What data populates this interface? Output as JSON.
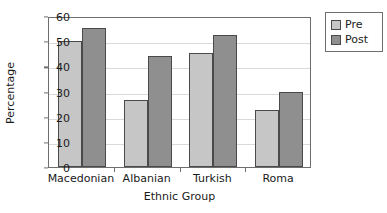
{
  "chart_data": {
    "type": "bar",
    "title": "",
    "subtitle": "",
    "xlabel": "Ethnic Group",
    "ylabel": "Percentage",
    "categories": [
      "Macedonian",
      "Albanian",
      "Turkish",
      "Roma"
    ],
    "series": [
      {
        "name": "Pre",
        "values": [
          50.0,
          26.7,
          45.3,
          22.7
        ],
        "color": "#c6c6c6"
      },
      {
        "name": "Post",
        "values": [
          55.4,
          44.2,
          52.5,
          30.0
        ],
        "color": "#8f8f8f"
      }
    ],
    "ylim": [
      0,
      60
    ],
    "yticks": [
      0,
      10,
      20,
      30,
      40,
      50,
      60
    ],
    "ytick_labels": [
      "0",
      "10",
      "20",
      "30",
      "40",
      "50",
      "60"
    ],
    "grid": true,
    "grid_axis": "y",
    "legend": {
      "position": "top-right",
      "entries": [
        "Pre",
        "Post"
      ]
    },
    "annotations": []
  },
  "legend": {
    "entries": [
      {
        "label": "Pre",
        "color": "#c6c6c6"
      },
      {
        "label": "Post",
        "color": "#8f8f8f"
      }
    ]
  },
  "axes": {
    "y_title": "Percentage",
    "x_title": "Ethnic Group"
  },
  "colors": {
    "pre": "#c6c6c6",
    "post": "#8f8f8f",
    "bar_edge": "#4a4a4a",
    "frame": "#6e6e6e",
    "gridline": "#d9d9d9",
    "text": "#1a1a1a",
    "background": "#ffffff"
  }
}
